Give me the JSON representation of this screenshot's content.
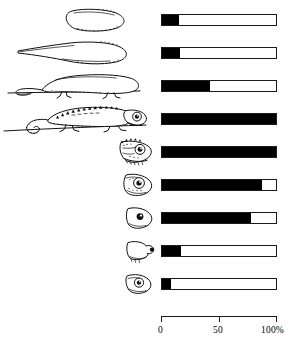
{
  "figure": {
    "title": "",
    "axis": {
      "unit_suffix": "%",
      "ticks": [
        {
          "value": 0,
          "label": "0"
        },
        {
          "value": 50,
          "label": "50"
        },
        {
          "value": 100,
          "label": "100%"
        }
      ]
    }
  },
  "chart_data": {
    "type": "bar",
    "title": "",
    "xlabel": "100%",
    "ylabel": "",
    "xlim": [
      0,
      100
    ],
    "grid": false,
    "legend": null,
    "orientation": "horizontal",
    "categories": [
      "egg-oval",
      "egg-with-tail",
      "embryo-lizard-on-branch",
      "juvenile-chameleon-on-branch",
      "head-detailed-casque",
      "head-with-eye-turret",
      "head-simplified-eye",
      "head-outline-snout",
      "head-plain-eye"
    ],
    "values": [
      15,
      16,
      42,
      100,
      100,
      88,
      78,
      17,
      8
    ],
    "series": [
      {
        "name": "percent",
        "values": [
          15,
          16,
          42,
          100,
          100,
          88,
          78,
          17,
          8
        ]
      }
    ],
    "rows": [
      {
        "icon": "egg-oval-icon",
        "value": 15
      },
      {
        "icon": "egg-with-tail-icon",
        "value": 16
      },
      {
        "icon": "embryo-lizard-icon",
        "value": 42
      },
      {
        "icon": "juvenile-chameleon-icon",
        "value": 100
      },
      {
        "icon": "head-detailed-casque-icon",
        "value": 100
      },
      {
        "icon": "head-eye-turret-icon",
        "value": 88
      },
      {
        "icon": "head-simplified-icon",
        "value": 78
      },
      {
        "icon": "head-outline-snout-icon",
        "value": 17
      },
      {
        "icon": "head-plain-eye-icon",
        "value": 8
      }
    ]
  }
}
